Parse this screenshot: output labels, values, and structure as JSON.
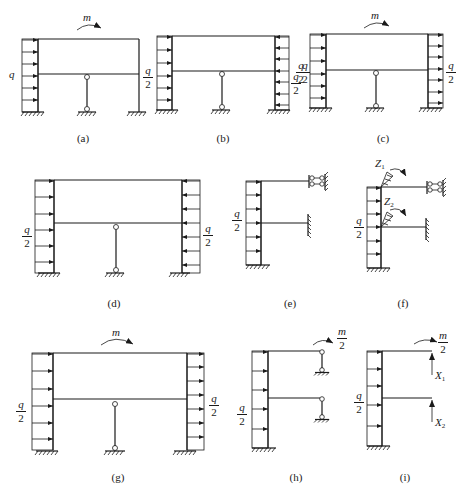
{
  "figure": {
    "panels": [
      {
        "id": "a",
        "caption": "(a)",
        "load_left": "q",
        "moment": "m"
      },
      {
        "id": "b",
        "caption": "(b)",
        "load_left_num": "q",
        "load_left_den": "2",
        "load_right_num": "q",
        "load_right_den": "2",
        "load_right_extra_num": "q",
        "load_right_extra_den": "2"
      },
      {
        "id": "c",
        "caption": "(c)",
        "load_left_num": "q",
        "load_left_den": "2",
        "load_right_num": "q",
        "load_right_den": "2",
        "moment": "m"
      },
      {
        "id": "d",
        "caption": "(d)",
        "load_left_num": "q",
        "load_left_den": "2",
        "load_right_num": "q",
        "load_right_den": "2"
      },
      {
        "id": "e",
        "caption": "(e)",
        "load_left_num": "q",
        "load_left_den": "2"
      },
      {
        "id": "f",
        "caption": "(f)",
        "load_left_num": "q",
        "load_left_den": "2",
        "z1": "Z",
        "z1_sub": "1",
        "z2": "Z",
        "z2_sub": "2"
      },
      {
        "id": "g",
        "caption": "(g)",
        "load_left_num": "q",
        "load_left_den": "2",
        "load_right_num": "q",
        "load_right_den": "2",
        "moment": "m"
      },
      {
        "id": "h",
        "caption": "(h)",
        "load_left_num": "q",
        "load_left_den": "2",
        "moment_num": "m",
        "moment_den": "2"
      },
      {
        "id": "i",
        "caption": "(i)",
        "load_left_num": "q",
        "load_left_den": "2",
        "moment_num": "m",
        "moment_den": "2",
        "x1": "X",
        "x1_sub": "1",
        "x2": "X",
        "x2_sub": "2"
      }
    ]
  }
}
